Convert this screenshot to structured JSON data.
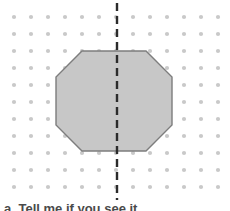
{
  "figure": {
    "background_color": "#ffffff",
    "width": 230,
    "height": 211
  },
  "dot_grid": {
    "label": "dot-grid",
    "dot_color": "#c9c9c9",
    "dot_radius": 2.1,
    "spacing_x": 17,
    "spacing_y": 17,
    "origin_x": 14,
    "origin_y": 17,
    "columns": 13,
    "rows": 11
  },
  "shape": {
    "label": "octagon",
    "type": "octagon",
    "fill_color": "#c7c7c7",
    "stroke_color": "#7d7d7d",
    "stroke_width": 1.4,
    "vertices": [
      [
        82,
        51
      ],
      [
        146,
        51
      ],
      [
        172,
        77
      ],
      [
        172,
        125
      ],
      [
        146,
        151
      ],
      [
        82,
        151
      ],
      [
        56,
        125
      ],
      [
        56,
        77
      ]
    ],
    "bounds": {
      "left": 56,
      "right": 172,
      "top": 51,
      "bottom": 151,
      "width": 116,
      "height": 100
    }
  },
  "symmetry_line": {
    "label": "line-of-symmetry",
    "orientation": "vertical",
    "x": 117,
    "y_start": 3,
    "y_end": 200,
    "color": "#2b2b2b",
    "stroke_width": 2.4,
    "dash_length": 8,
    "gap_length": 5
  },
  "caption": {
    "text": "a. Tell me if you see it.",
    "color": "#4a4a4a",
    "truncated": true
  }
}
